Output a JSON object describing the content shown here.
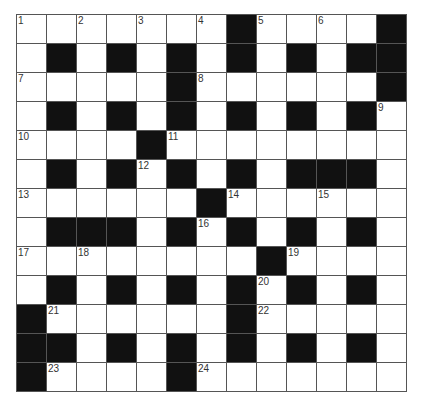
{
  "puzzle": {
    "type": "crossword",
    "rows": 13,
    "cols": 13,
    "colors": {
      "block": "#111111",
      "cell": "#ffffff",
      "gridline": "#555555",
      "number": "#333333"
    },
    "grid": [
      [
        "1",
        ".",
        "2",
        ".",
        "3",
        ".",
        "4",
        "#",
        "5",
        ".",
        "6",
        ".",
        "#"
      ],
      [
        ".",
        "#",
        ".",
        "#",
        ".",
        "#",
        ".",
        "#",
        ".",
        "#",
        ".",
        "#",
        "#"
      ],
      [
        "7",
        ".",
        ".",
        ".",
        ".",
        "#",
        "8",
        ".",
        ".",
        ".",
        ".",
        ".",
        "#"
      ],
      [
        ".",
        "#",
        ".",
        "#",
        ".",
        "#",
        ".",
        "#",
        ".",
        "#",
        ".",
        "#",
        "9"
      ],
      [
        "10",
        ".",
        ".",
        ".",
        "#",
        "11",
        ".",
        ".",
        ".",
        ".",
        ".",
        ".",
        "."
      ],
      [
        ".",
        "#",
        ".",
        "#",
        "12",
        "#",
        ".",
        "#",
        ".",
        "#",
        "#",
        "#",
        "."
      ],
      [
        "13",
        ".",
        ".",
        ".",
        ".",
        ".",
        "#",
        "14",
        ".",
        ".",
        "15",
        ".",
        "."
      ],
      [
        ".",
        "#",
        "#",
        "#",
        ".",
        "#",
        "16",
        "#",
        ".",
        "#",
        ".",
        "#",
        "."
      ],
      [
        "17",
        ".",
        "18",
        ".",
        ".",
        ".",
        ".",
        ".",
        "#",
        "19",
        ".",
        ".",
        "."
      ],
      [
        ".",
        "#",
        ".",
        "#",
        ".",
        "#",
        ".",
        "#",
        "20",
        "#",
        ".",
        "#",
        "."
      ],
      [
        "#",
        "21",
        ".",
        ".",
        ".",
        ".",
        ".",
        "#",
        "22",
        ".",
        ".",
        ".",
        "."
      ],
      [
        "#",
        "#",
        ".",
        "#",
        ".",
        "#",
        ".",
        "#",
        ".",
        "#",
        ".",
        "#",
        "."
      ],
      [
        "#",
        "23",
        ".",
        ".",
        ".",
        "#",
        "24",
        ".",
        ".",
        ".",
        ".",
        ".",
        "."
      ]
    ],
    "clue_numbers": [
      "1",
      "2",
      "3",
      "4",
      "5",
      "6",
      "7",
      "8",
      "9",
      "10",
      "11",
      "12",
      "13",
      "14",
      "15",
      "16",
      "17",
      "18",
      "19",
      "20",
      "21",
      "22",
      "23",
      "24"
    ]
  }
}
